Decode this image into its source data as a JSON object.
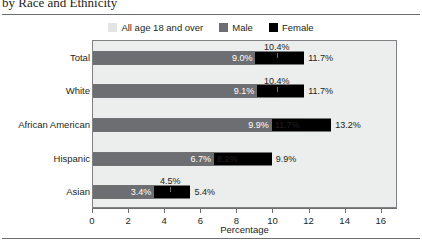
{
  "figure": {
    "title": "by Race and Ethnicity",
    "x_axis_title": "Percentage"
  },
  "legend": {
    "items": [
      {
        "label": "All age 18 and over",
        "swatch": "legend-swatch-all",
        "color": "#e3e4e5"
      },
      {
        "label": "Male",
        "swatch": "legend-swatch-male",
        "color": "#6d6e71"
      },
      {
        "label": "Female",
        "swatch": "legend-swatch-female",
        "color": "#000000"
      }
    ]
  },
  "chart_data": {
    "type": "bar",
    "orientation": "horizontal",
    "title": "by Race and Ethnicity",
    "xlabel": "Percentage",
    "ylabel": "",
    "xlim": [
      0,
      16.9
    ],
    "xticks": [
      0,
      2,
      4,
      6,
      8,
      10,
      12,
      14,
      16
    ],
    "xtick_labels": [
      "0",
      "2",
      "4",
      "6",
      "8",
      "10",
      "12",
      "14",
      "16"
    ],
    "grid": false,
    "legend_position": "top-center",
    "categories": [
      "Total",
      "White",
      "African American",
      "Hispanic",
      "Asian"
    ],
    "series": [
      {
        "name": "All age 18 and over",
        "color": "#e3e4e5",
        "values": [
          10.4,
          10.4,
          11.7,
          4.5,
          4.5
        ]
      },
      {
        "name": "Male",
        "color": "#6d6e71",
        "values": [
          9.0,
          9.1,
          9.9,
          6.7,
          3.4
        ]
      },
      {
        "name": "Female",
        "color": "#000000",
        "values": [
          11.7,
          11.7,
          13.2,
          9.9,
          5.4
        ]
      }
    ],
    "rows": [
      {
        "category": "Total",
        "male": {
          "value": 9.0,
          "label": "9.0%",
          "label_position": "inside"
        },
        "all": {
          "value": 10.4,
          "label": "10.4%",
          "label_position": "above-callout"
        },
        "female": {
          "value": 11.7,
          "label": "11.7%",
          "label_position": "outside"
        }
      },
      {
        "category": "White",
        "male": {
          "value": 9.1,
          "label": "9.1%",
          "label_position": "inside"
        },
        "all": {
          "value": 10.4,
          "label": "10.4%",
          "label_position": "above-callout"
        },
        "female": {
          "value": 11.7,
          "label": "11.7%",
          "label_position": "outside"
        }
      },
      {
        "category": "African American",
        "male": {
          "value": 9.9,
          "label": "9.9%",
          "label_position": "inside"
        },
        "all": {
          "value": 11.7,
          "label": "11.7%",
          "label_position": "inline"
        },
        "female": {
          "value": 13.2,
          "label": "13.2%",
          "label_position": "outside"
        }
      },
      {
        "category": "Hispanic",
        "male": {
          "value": 6.7,
          "label": "6.7%",
          "label_position": "inside"
        },
        "all": {
          "value": 8.2,
          "label": "8.2%",
          "label_position": "inline"
        },
        "female": {
          "value": 9.9,
          "label": "9.9%",
          "label_position": "outside"
        }
      },
      {
        "category": "Asian",
        "male": {
          "value": 3.4,
          "label": "3.4%",
          "label_position": "inside"
        },
        "all": {
          "value": 4.5,
          "label": "4.5%",
          "label_position": "above-callout"
        },
        "female": {
          "value": 5.4,
          "label": "5.4%",
          "label_position": "outside"
        }
      }
    ]
  }
}
